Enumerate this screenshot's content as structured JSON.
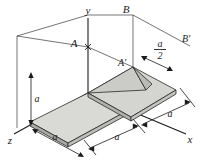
{
  "figure": {
    "background_color": "#ffffff",
    "line_color": "#1a1a1a",
    "plate_top_fill": "#d8d8d4",
    "plate_edge_fill": "#b4b4b0",
    "triangle_fill_light": "#d2d2ce",
    "triangle_fill_dark": "#bdbdb9",
    "axes": [
      {
        "name": "y-axis",
        "label": "y",
        "direction": "up"
      },
      {
        "name": "x-axis",
        "label": "x",
        "direction": "lower-right"
      },
      {
        "name": "z-axis",
        "label": "z",
        "direction": "lower-left"
      }
    ],
    "points": [
      {
        "name": "point-A",
        "label": "A"
      },
      {
        "name": "point-A-prime",
        "label": "A'"
      },
      {
        "name": "point-B",
        "label": "B"
      },
      {
        "name": "point-B-prime",
        "label": "B'"
      }
    ],
    "dimensions": [
      {
        "name": "dim-height-a",
        "label": "a",
        "position": "left-vertical"
      },
      {
        "name": "dim-z-a",
        "label": "a",
        "position": "bottom-left"
      },
      {
        "name": "dim-x-a-near",
        "label": "a",
        "position": "bottom-center"
      },
      {
        "name": "dim-x-a-far",
        "label": "a",
        "position": "bottom-right"
      },
      {
        "name": "dim-half-a",
        "numerator": "a",
        "denominator": "2",
        "label": "a/2",
        "position": "upper-right"
      }
    ]
  }
}
